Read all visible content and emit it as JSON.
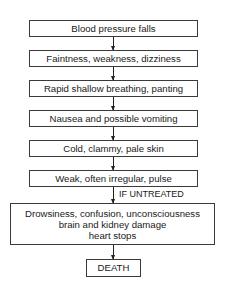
{
  "flowchart": {
    "steps": [
      "Blood pressure falls",
      "Faintness, weakness, dizziness",
      "Rapid shallow breathing, panting",
      "Nausea and possible vomiting",
      "Cold, clammy, pale skin",
      "Weak, often irregular, pulse"
    ],
    "branch_label": "IF UNTREATED",
    "untreated_box": [
      "Drowsiness, confusion, unconsciousness",
      "brain and kidney damage",
      "heart stops"
    ],
    "final": "DEATH"
  }
}
